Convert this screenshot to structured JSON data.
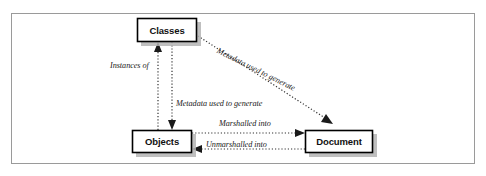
{
  "figure": {
    "type": "diagram",
    "title": "",
    "border_color": "#9a9a9a",
    "background": "#ffffff",
    "node_fill": "#ffffff",
    "node_border": "#000000",
    "shadow_color": "#b0b0b0",
    "connector_style": "dotted",
    "connector_color": "#333333"
  },
  "nodes": [
    {
      "id": "classes",
      "label": "Classes",
      "x": 137,
      "y": 18,
      "w": 60,
      "h": 24
    },
    {
      "id": "objects",
      "label": "Objects",
      "x": 132,
      "y": 130,
      "w": 60,
      "h": 23
    },
    {
      "id": "document",
      "label": "Document",
      "x": 305,
      "y": 130,
      "w": 68,
      "h": 23
    }
  ],
  "edges": [
    {
      "id": "instances-of",
      "label": "Instances of",
      "from": "objects",
      "to": "classes",
      "direction": "up",
      "style": "dotted"
    },
    {
      "id": "metadata-used-to-generate-objects",
      "label": "Metadata used to generate",
      "from": "classes",
      "to": "objects",
      "direction": "down",
      "style": "dotted"
    },
    {
      "id": "metadata-used-to-generate-document",
      "label": "Metadata used to generate",
      "from": "classes",
      "to": "document",
      "direction": "diagonal-down-right",
      "style": "dotted"
    },
    {
      "id": "marshalled-into",
      "label": "Marshalled into",
      "from": "objects",
      "to": "document",
      "direction": "right",
      "style": "dotted"
    },
    {
      "id": "unmarshalled-into",
      "label": "Unmarshalled into",
      "from": "document",
      "to": "objects",
      "direction": "left",
      "style": "dotted"
    }
  ],
  "labels": {
    "instances_of": "Instances of",
    "metadata_objects": "Metadata used to generate",
    "metadata_document": "Metadata used to generate",
    "marshalled_into": "Marshalled into",
    "unmarshalled_into": "Unmarshalled into"
  }
}
